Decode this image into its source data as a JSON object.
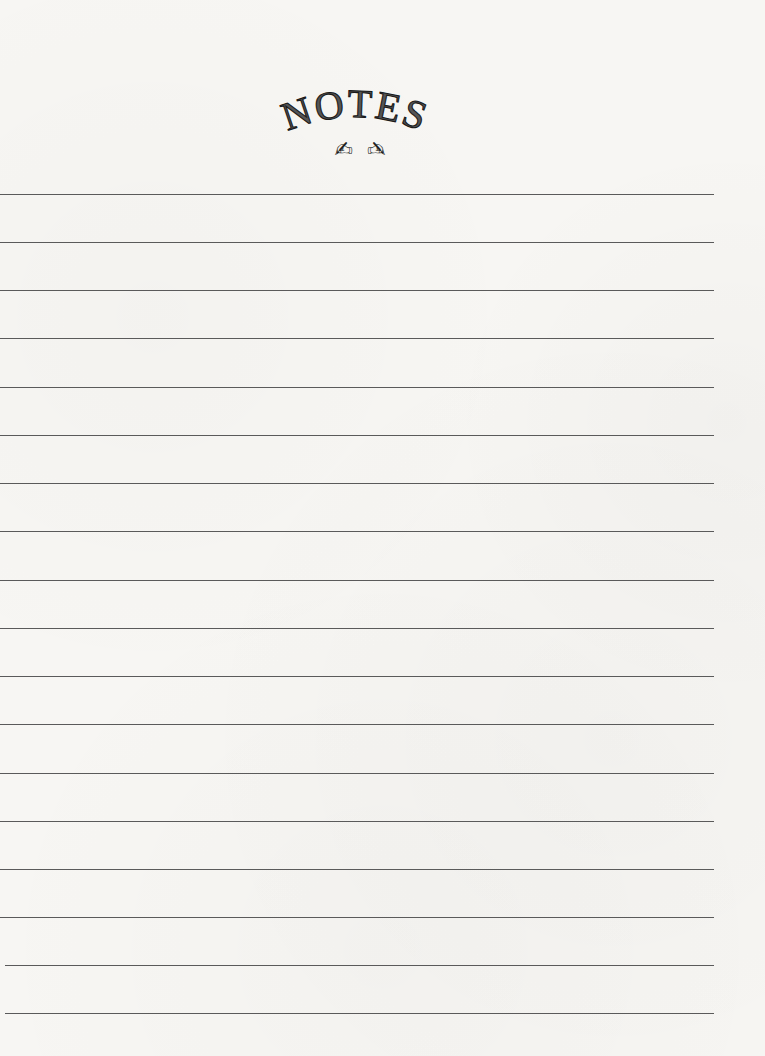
{
  "page": {
    "title": "NOTES",
    "icons": [
      {
        "name": "writing-hand-icon",
        "glyph": "✍",
        "mirrored": false
      },
      {
        "name": "writing-hand-icon",
        "glyph": "✍",
        "mirrored": true
      }
    ],
    "colors": {
      "paper": "#f7f6f3",
      "rule": "#5a5a5a",
      "title_fill": "#555555",
      "title_stroke": "#1a1a1a"
    },
    "ruled_lines": {
      "count": 18,
      "positions_y": [
        194,
        242,
        290,
        338,
        387,
        435,
        483,
        531,
        580,
        628,
        676,
        724,
        773,
        821,
        869,
        917,
        965,
        1013
      ],
      "x_start": 0,
      "x_end": 714
    }
  }
}
